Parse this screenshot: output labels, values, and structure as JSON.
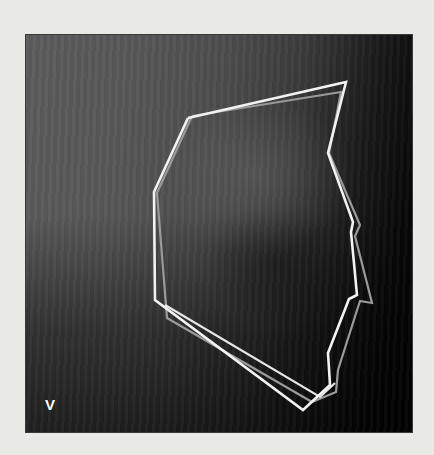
{
  "figure": {
    "panel_label": "V",
    "image_description": "Lateral radiograph with two overlaid polygonal outlines (white and gray)",
    "colors": {
      "page_background": "#e9e9e6",
      "outline_primary": "#f2f2f2",
      "outline_secondary": "#9a9a9a",
      "label": "#ffffff"
    },
    "outlines": [
      {
        "name": "outline-white",
        "points": "188,118 346,82 328,153 353,222 351,232 357,295 349,299 328,353 330,385 303,410 155,300 154,192 188,118"
      },
      {
        "name": "outline-white-inner",
        "points": "165,305 320,397 335,383"
      },
      {
        "name": "outline-gray",
        "points": "192,116 341,92 329,153 360,225 355,236 372,303 360,301 338,370 336,392 312,402 167,318 157,193 192,116"
      }
    ]
  }
}
